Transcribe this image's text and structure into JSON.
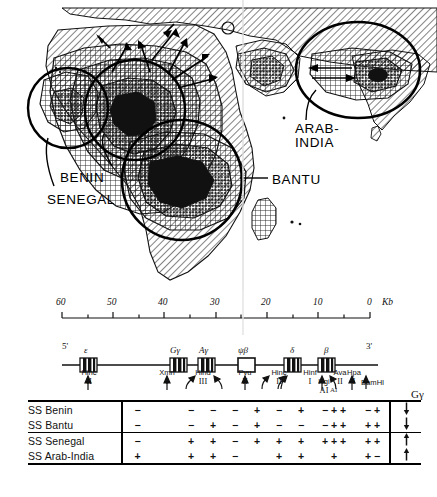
{
  "figure": {
    "accent_color": "#000000",
    "background_color": "#ffffff"
  },
  "map": {
    "name": "world-distribution-map",
    "regions": [
      {
        "id": "senegal",
        "label": "SENEGAL"
      },
      {
        "id": "benin",
        "label": "BENIN"
      },
      {
        "id": "bantu",
        "label": "BANTU"
      },
      {
        "id": "arab-india",
        "label": "ARAB-\nINDIA"
      }
    ],
    "labels": {
      "benin": "BENIN",
      "senegal": "SENEGAL",
      "bantu": "BANTU",
      "arab_india_line1": "ARAB-",
      "arab_india_line2": "INDIA"
    },
    "annotations": {
      "question_mark": "?"
    }
  },
  "scale": {
    "name": "kb-scale-bar",
    "unit": "Kb",
    "ticks": [
      {
        "value": "60",
        "major": true
      },
      {
        "value": "",
        "major": false
      },
      {
        "value": "50",
        "major": true
      },
      {
        "value": "",
        "major": false
      },
      {
        "value": "40",
        "major": true
      },
      {
        "value": "",
        "major": false
      },
      {
        "value": "30",
        "major": true
      },
      {
        "value": "",
        "major": false
      },
      {
        "value": "20",
        "major": true
      },
      {
        "value": "",
        "major": false
      },
      {
        "value": "10",
        "major": true
      },
      {
        "value": "",
        "major": false
      },
      {
        "value": "0",
        "major": true
      }
    ],
    "labels": [
      "60",
      "50",
      "40",
      "30",
      "20",
      "10",
      "0"
    ]
  },
  "gene_map": {
    "name": "beta-globin-gene-cluster",
    "five_prime": "5'",
    "three_prime": "3'",
    "genes": [
      {
        "symbol": "ε",
        "name": "epsilon",
        "type": "filled"
      },
      {
        "symbol": "Gγ",
        "name": "G-gamma",
        "type": "filled"
      },
      {
        "symbol": "Aγ",
        "name": "A-gamma",
        "type": "filled"
      },
      {
        "symbol": "ψβ",
        "name": "psi-beta",
        "type": "open"
      },
      {
        "symbol": "δ",
        "name": "delta",
        "type": "filled"
      },
      {
        "symbol": "β",
        "name": "beta",
        "type": "filled"
      }
    ],
    "enzymes": [
      {
        "name": "Hinc",
        "roman": "II",
        "sites": 1
      },
      {
        "name": "Xmn",
        "roman": "I",
        "sites": 1
      },
      {
        "name": "Hind",
        "roman": "III",
        "sites": 2
      },
      {
        "name": "Pvu",
        "roman": "II",
        "sites": 1
      },
      {
        "name": "Hinc",
        "roman": "II",
        "sites": 2
      },
      {
        "name": "Hinf",
        "roman": "I",
        "sites": 1
      },
      {
        "name": "Hgi",
        "roman": "AI",
        "sites": 1
      },
      {
        "name": "Ava",
        "roman": "II",
        "sites": 1
      },
      {
        "name": "Hpa",
        "roman": "I",
        "sites": 1
      },
      {
        "name": "Bam",
        "roman": "HI",
        "sites": 1
      }
    ]
  },
  "haplotype_table": {
    "name": "haplotype-polymorphism-table",
    "gamma_header": "Gγ",
    "al_header": "AΙ",
    "columns": 11,
    "rows": [
      {
        "haplotype": "SS Benin",
        "signs": [
          "−",
          "",
          "−",
          "−",
          "−",
          "+",
          "−",
          "+",
          "− + +",
          "− +"
        ],
        "gamma_arrow": "down"
      },
      {
        "haplotype": "SS Bantu",
        "signs": [
          "−",
          "",
          "−",
          "+",
          "−",
          "+",
          "−",
          "−",
          "− + +",
          "+ +"
        ],
        "gamma_arrow": "down"
      },
      {
        "haplotype": "SS Senegal",
        "signs": [
          "−",
          "",
          "+",
          "+",
          "−",
          "+",
          "+",
          "+",
          "+ + +",
          "+ +"
        ],
        "gamma_arrow": "up"
      },
      {
        "haplotype": "SS Arab-India",
        "signs": [
          "+",
          "",
          "+",
          "+",
          "−",
          "",
          "+",
          "+",
          "+",
          "+ −"
        ],
        "gamma_arrow": "up"
      }
    ],
    "arrow_glyphs": {
      "up": "↑",
      "down": "↓"
    }
  }
}
